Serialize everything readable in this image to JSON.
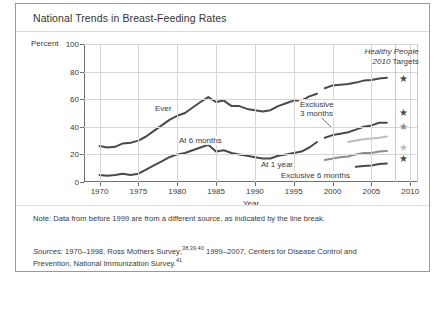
{
  "figure": {
    "title": "National Trends in Breast-Feeding Rates",
    "y_axis_name": "Percent",
    "x_axis_title": "Year",
    "targets_heading_line1": "Healthy People",
    "targets_heading_line2_italic": "2010",
    "targets_heading_line2_rest": " Targets",
    "note_label": "Note:",
    "note_text": " Data from before 1999 are from a different source, as indicated by the line break.",
    "sources_label": "Sources:",
    "sources_part1": " 1970–1998, Ross Mothers Survey;",
    "sources_sup1": "38,39,40",
    "sources_part2": " 1999–2007, Centers for Disease Control and Prevention, National Immunization Survey.",
    "sources_sup2": "41"
  },
  "colors": {
    "dark": "#4a4a4a",
    "medium": "#8c8c8c",
    "light": "#bcbcbc",
    "axis": "#6e6e6e",
    "grid": "#d6d6d6",
    "border": "#9a9a9a"
  },
  "chart_data": {
    "type": "line",
    "title": "National Trends in Breast-Feeding Rates",
    "xlabel": "Year",
    "ylabel": "Percent",
    "xlim": [
      1968,
      2011
    ],
    "ylim": [
      0,
      100
    ],
    "yticks": [
      0,
      20,
      40,
      60,
      80,
      100
    ],
    "xticks": [
      1970,
      1975,
      1980,
      1985,
      1990,
      1995,
      2000,
      2005,
      2010
    ],
    "grid": true,
    "legend": "inline-labels",
    "break_year": 1999,
    "break_note": "Data before 1999 from Ross Mothers Survey; 1999-2007 from National Immunization Survey",
    "series": [
      {
        "name": "Ever",
        "label": "Ever",
        "color": "#4a4a4a",
        "segment": "pre-1999",
        "points": [
          [
            1970,
            26
          ],
          [
            1971,
            25
          ],
          [
            1972,
            25.5
          ],
          [
            1973,
            28
          ],
          [
            1974,
            28.5
          ],
          [
            1975,
            30
          ],
          [
            1976,
            33
          ],
          [
            1977,
            37
          ],
          [
            1978,
            41
          ],
          [
            1979,
            45
          ],
          [
            1980,
            48
          ],
          [
            1981,
            50
          ],
          [
            1982,
            54
          ],
          [
            1983,
            58
          ],
          [
            1984,
            61.5
          ],
          [
            1985,
            58
          ],
          [
            1986,
            59
          ],
          [
            1987,
            55
          ],
          [
            1988,
            55
          ],
          [
            1989,
            53
          ],
          [
            1990,
            52
          ],
          [
            1991,
            51
          ],
          [
            1992,
            52
          ],
          [
            1993,
            55
          ],
          [
            1994,
            57
          ],
          [
            1995,
            59
          ],
          [
            1996,
            59
          ],
          [
            1997,
            62
          ],
          [
            1998,
            64
          ]
        ]
      },
      {
        "name": "Ever",
        "label": "",
        "color": "#4a4a4a",
        "segment": "post-1999",
        "points": [
          [
            1999,
            68
          ],
          [
            2000,
            70
          ],
          [
            2001,
            70.5
          ],
          [
            2002,
            71
          ],
          [
            2003,
            72
          ],
          [
            2004,
            73.5
          ],
          [
            2005,
            74
          ],
          [
            2006,
            75
          ],
          [
            2007,
            75.5
          ]
        ]
      },
      {
        "name": "At 6 months",
        "label": "At 6 months",
        "color": "#4a4a4a",
        "segment": "pre-1999",
        "points": [
          [
            1970,
            5
          ],
          [
            1971,
            4.5
          ],
          [
            1972,
            5
          ],
          [
            1973,
            6
          ],
          [
            1974,
            5
          ],
          [
            1975,
            6
          ],
          [
            1976,
            9
          ],
          [
            1977,
            12
          ],
          [
            1978,
            15
          ],
          [
            1979,
            18
          ],
          [
            1980,
            20
          ],
          [
            1981,
            21
          ],
          [
            1982,
            23
          ],
          [
            1983,
            25
          ],
          [
            1984,
            27
          ],
          [
            1985,
            22
          ],
          [
            1986,
            23
          ],
          [
            1987,
            21
          ],
          [
            1988,
            20
          ],
          [
            1989,
            19
          ],
          [
            1990,
            18
          ],
          [
            1991,
            17
          ],
          [
            1992,
            17
          ],
          [
            1993,
            19
          ],
          [
            1994,
            20
          ],
          [
            1995,
            21
          ],
          [
            1996,
            22
          ],
          [
            1997,
            25
          ],
          [
            1998,
            29
          ]
        ]
      },
      {
        "name": "At 6 months",
        "label": "",
        "color": "#4a4a4a",
        "segment": "post-1999",
        "points": [
          [
            1999,
            32
          ],
          [
            2000,
            34
          ],
          [
            2001,
            35
          ],
          [
            2002,
            36
          ],
          [
            2003,
            38
          ],
          [
            2004,
            40
          ],
          [
            2005,
            41
          ],
          [
            2006,
            43
          ],
          [
            2007,
            43
          ]
        ]
      },
      {
        "name": "At 1 year",
        "label": "At 1 year",
        "color": "#8c8c8c",
        "segment": "post-1999",
        "points": [
          [
            1999,
            16
          ],
          [
            2000,
            17
          ],
          [
            2001,
            18
          ],
          [
            2002,
            18.5
          ],
          [
            2003,
            20
          ],
          [
            2004,
            21
          ],
          [
            2005,
            21
          ],
          [
            2006,
            22
          ],
          [
            2007,
            22.5
          ]
        ]
      },
      {
        "name": "Exclusive 3 months",
        "label": "Exclusive 3 months",
        "color": "#bcbcbc",
        "segment": "post-1999",
        "points": [
          [
            2002,
            29
          ],
          [
            2003,
            30
          ],
          [
            2004,
            31
          ],
          [
            2005,
            31.5
          ],
          [
            2006,
            32
          ],
          [
            2007,
            33
          ]
        ]
      },
      {
        "name": "Exclusive 6 months",
        "label": "Exclusive 6 months",
        "color": "#4a4a4a",
        "segment": "post-1999",
        "points": [
          [
            2003,
            11
          ],
          [
            2004,
            11.5
          ],
          [
            2005,
            12
          ],
          [
            2006,
            13
          ],
          [
            2007,
            13.5
          ]
        ]
      }
    ],
    "targets": [
      {
        "label": "Ever target",
        "value": 75,
        "color": "#4a4a4a"
      },
      {
        "label": "At 6 months target",
        "value": 50,
        "color": "#4a4a4a"
      },
      {
        "label": "Exclusive 3 months target",
        "value": 40,
        "color": "#8c8c8c"
      },
      {
        "label": "Exclusive 6 months target",
        "value": 25,
        "color": "#bcbcbc"
      },
      {
        "label": "At 1 year target",
        "value": 17,
        "color": "#4a4a4a"
      }
    ],
    "target_marker": "star"
  },
  "plot_labels": [
    {
      "text": "Ever",
      "x": 70,
      "y": 60
    },
    {
      "text": "At 6 months",
      "x": 94,
      "y": 92
    },
    {
      "text": "Exclusive",
      "x": 215,
      "y": 56
    },
    {
      "text": "3 months",
      "x": 215,
      "y": 65
    },
    {
      "text": "At 1 year",
      "x": 176,
      "y": 116
    },
    {
      "text": "Exclusive 6 months",
      "x": 196,
      "y": 127
    }
  ]
}
